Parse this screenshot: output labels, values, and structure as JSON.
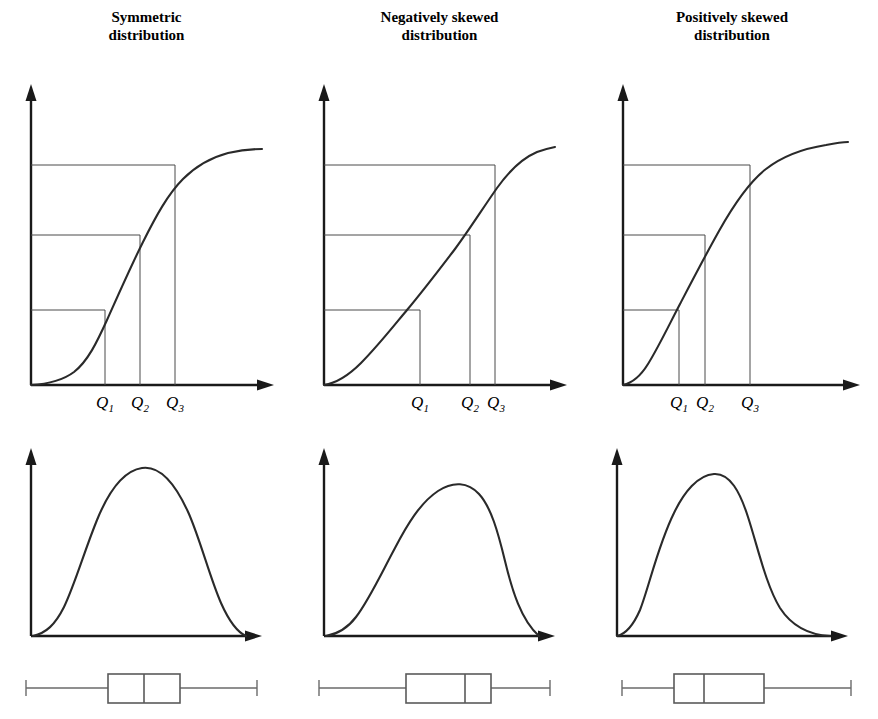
{
  "figure": {
    "caption_visible": false,
    "background_color": "#ffffff",
    "ink_color": "#1a1a1a",
    "guide_color": "#4a4a4a"
  },
  "columns": [
    {
      "title": "Symmetric\ndistribution"
    },
    {
      "title": "Negatively skewed\ndistribution"
    },
    {
      "title": "Positively skewed\ndistribution"
    }
  ],
  "quartile_labels": {
    "q1": "Q",
    "q1_sub": "1",
    "q2": "Q",
    "q2_sub": "2",
    "q3": "Q",
    "q3_sub": "3"
  },
  "chart_data": [
    {
      "type": "line",
      "name": "symmetric-cdf",
      "title": "Symmetric distribution",
      "subplot": "cumulative distribution function",
      "xlabel": "",
      "ylabel": "",
      "xlim": [
        0,
        1
      ],
      "ylim": [
        0,
        1
      ],
      "grid": false,
      "legend": "none",
      "quartile_positions_x": [
        0.32,
        0.47,
        0.62
      ],
      "quartile_levels_y": [
        0.25,
        0.5,
        0.75
      ],
      "quartile_tick_labels": [
        "Q1",
        "Q2",
        "Q3"
      ],
      "x": [
        0.0,
        0.06,
        0.12,
        0.18,
        0.24,
        0.3,
        0.36,
        0.42,
        0.48,
        0.54,
        0.6,
        0.66,
        0.72,
        0.78,
        0.84,
        0.9,
        0.96,
        1.0
      ],
      "y": [
        0.0,
        0.01,
        0.03,
        0.07,
        0.13,
        0.21,
        0.32,
        0.43,
        0.53,
        0.63,
        0.72,
        0.8,
        0.87,
        0.92,
        0.96,
        0.98,
        0.99,
        1.0
      ]
    },
    {
      "type": "line",
      "name": "negatively-skewed-cdf",
      "title": "Negatively skewed distribution",
      "subplot": "cumulative distribution function",
      "xlabel": "",
      "ylabel": "",
      "xlim": [
        0,
        1
      ],
      "ylim": [
        0,
        1
      ],
      "grid": false,
      "legend": "none",
      "quartile_positions_x": [
        0.39,
        0.6,
        0.71
      ],
      "quartile_levels_y": [
        0.25,
        0.5,
        0.75
      ],
      "quartile_tick_labels": [
        "Q1",
        "Q2",
        "Q3"
      ],
      "x": [
        0.0,
        0.06,
        0.12,
        0.18,
        0.24,
        0.3,
        0.36,
        0.42,
        0.48,
        0.54,
        0.6,
        0.66,
        0.72,
        0.78,
        0.84,
        0.9,
        0.96,
        1.0
      ],
      "y": [
        0.0,
        0.02,
        0.05,
        0.09,
        0.13,
        0.18,
        0.23,
        0.29,
        0.35,
        0.42,
        0.5,
        0.59,
        0.68,
        0.78,
        0.87,
        0.94,
        0.98,
        1.0
      ]
    },
    {
      "type": "line",
      "name": "positively-skewed-cdf",
      "title": "Positively skewed distribution",
      "subplot": "cumulative distribution function",
      "xlabel": "",
      "ylabel": "",
      "xlim": [
        0,
        1
      ],
      "ylim": [
        0,
        1
      ],
      "grid": false,
      "legend": "none",
      "quartile_positions_x": [
        0.27,
        0.38,
        0.58
      ],
      "quartile_levels_y": [
        0.25,
        0.5,
        0.75
      ],
      "quartile_tick_labels": [
        "Q1",
        "Q2",
        "Q3"
      ],
      "x": [
        0.0,
        0.06,
        0.12,
        0.18,
        0.24,
        0.3,
        0.36,
        0.42,
        0.48,
        0.54,
        0.6,
        0.66,
        0.72,
        0.78,
        0.84,
        0.9,
        0.96,
        1.0
      ],
      "y": [
        0.0,
        0.06,
        0.13,
        0.21,
        0.3,
        0.4,
        0.5,
        0.59,
        0.67,
        0.74,
        0.8,
        0.85,
        0.89,
        0.93,
        0.96,
        0.98,
        0.99,
        1.0
      ]
    },
    {
      "type": "line",
      "name": "symmetric-pdf",
      "title": "Symmetric distribution",
      "subplot": "probability density function",
      "xlabel": "",
      "ylabel": "",
      "xlim": [
        0,
        1
      ],
      "ylim": [
        0,
        1
      ],
      "grid": false,
      "legend": "none",
      "mode_x": 0.47,
      "x": [
        0.0,
        0.06,
        0.12,
        0.18,
        0.24,
        0.3,
        0.36,
        0.42,
        0.47,
        0.52,
        0.58,
        0.64,
        0.7,
        0.76,
        0.82,
        0.88,
        0.94,
        1.0
      ],
      "y": [
        0.0,
        0.04,
        0.11,
        0.24,
        0.44,
        0.67,
        0.87,
        0.98,
        1.0,
        0.98,
        0.9,
        0.76,
        0.57,
        0.37,
        0.2,
        0.09,
        0.03,
        0.0
      ]
    },
    {
      "type": "line",
      "name": "negatively-skewed-pdf",
      "title": "Negatively skewed distribution",
      "subplot": "probability density function",
      "xlabel": "",
      "ylabel": "",
      "xlim": [
        0,
        1
      ],
      "ylim": [
        0,
        1
      ],
      "grid": false,
      "legend": "none",
      "mode_x": 0.6,
      "x": [
        0.0,
        0.06,
        0.12,
        0.18,
        0.24,
        0.3,
        0.36,
        0.42,
        0.48,
        0.54,
        0.6,
        0.66,
        0.72,
        0.78,
        0.84,
        0.9,
        0.95,
        1.0
      ],
      "y": [
        0.0,
        0.03,
        0.08,
        0.16,
        0.27,
        0.41,
        0.56,
        0.71,
        0.84,
        0.95,
        1.0,
        0.97,
        0.85,
        0.62,
        0.35,
        0.14,
        0.04,
        0.0
      ]
    },
    {
      "type": "line",
      "name": "positively-skewed-pdf",
      "title": "Positively skewed distribution",
      "subplot": "probability density function",
      "xlabel": "",
      "ylabel": "",
      "xlim": [
        0,
        1
      ],
      "ylim": [
        0,
        1
      ],
      "grid": false,
      "legend": "none",
      "mode_x": 0.32,
      "x": [
        0.0,
        0.05,
        0.1,
        0.16,
        0.22,
        0.27,
        0.32,
        0.38,
        0.44,
        0.5,
        0.56,
        0.62,
        0.7,
        0.78,
        0.86,
        0.92,
        0.96,
        1.0
      ],
      "y": [
        0.0,
        0.06,
        0.22,
        0.55,
        0.86,
        0.98,
        1.0,
        0.97,
        0.9,
        0.8,
        0.68,
        0.55,
        0.37,
        0.21,
        0.09,
        0.03,
        0.01,
        0.0
      ]
    },
    {
      "type": "table",
      "name": "symmetric-boxplot",
      "title": "Symmetric distribution",
      "subplot": "box plot",
      "five_number_summary": {
        "min": 0.06,
        "q1": 0.37,
        "median": 0.505,
        "q3": 0.64,
        "max": 0.94
      },
      "median_offset_in_box": "centered"
    },
    {
      "type": "table",
      "name": "negatively-skewed-boxplot",
      "title": "Negatively skewed distribution",
      "subplot": "box plot",
      "five_number_summary": {
        "min": 0.06,
        "q1": 0.39,
        "median": 0.6,
        "q3": 0.68,
        "max": 0.94
      },
      "median_offset_in_box": "right-of-center"
    },
    {
      "type": "table",
      "name": "positively-skewed-boxplot",
      "title": "Positively skewed distribution",
      "subplot": "box plot",
      "five_number_summary": {
        "min": 0.06,
        "q1": 0.31,
        "median": 0.4,
        "q3": 0.62,
        "max": 0.94
      },
      "median_offset_in_box": "left-of-center"
    }
  ]
}
